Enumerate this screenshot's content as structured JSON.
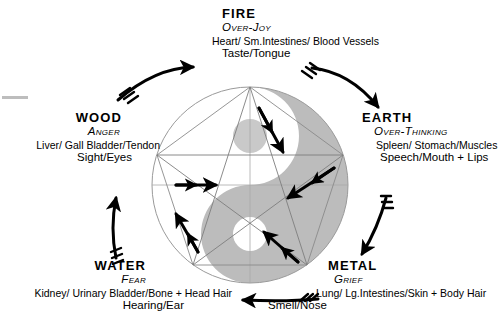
{
  "diagram": {
    "center_symbol": "yin-yang",
    "colors": {
      "yin_grey": "#b9b9b9",
      "line_grey": "#8c8c8c",
      "ink": "#000000",
      "background": "#ffffff"
    },
    "elements": [
      {
        "id": "fire",
        "name": "FIRE",
        "emotion": "Over-Joy",
        "organs": [
          {
            "text": "Heart",
            "style": "bold"
          },
          {
            "text": "Sm.Intestines",
            "style": "bold-italic"
          },
          {
            "text": "Blood Vessels",
            "style": "small-caps"
          }
        ],
        "organs_text": "Heart/ Sm.Intestines/ Blood Vessels",
        "sense": "Taste",
        "sense_organ": "Tongue",
        "sense_text": "Taste/Tongue",
        "position": "top"
      },
      {
        "id": "wood",
        "name": "WOOD",
        "emotion": "Anger",
        "organs": [
          {
            "text": "Liver",
            "style": "bold"
          },
          {
            "text": "Gall Bladder",
            "style": "bold-italic"
          },
          {
            "text": "Tendon",
            "style": "small-caps"
          }
        ],
        "organs_text": "Liver/ Gall Bladder/Tendon",
        "sense": "Sight",
        "sense_organ": "Eyes",
        "sense_text": "Sight/Eyes",
        "position": "left"
      },
      {
        "id": "earth",
        "name": "EARTH",
        "emotion": "Over-Thinking",
        "organs": [
          {
            "text": "Spleen",
            "style": "bold"
          },
          {
            "text": "Stomach",
            "style": "bold-italic"
          },
          {
            "text": "Muscles",
            "style": "small-caps"
          }
        ],
        "organs_text": "Spleen/ Stomach/Muscles",
        "sense": "Speech",
        "sense_organ": "Mouth + Lips",
        "sense_text": "Speech/Mouth + Lips",
        "position": "right"
      },
      {
        "id": "metal",
        "name": "METAL",
        "emotion": "Grief",
        "organs": [
          {
            "text": "Lung",
            "style": "bold"
          },
          {
            "text": "Lg.Intestines",
            "style": "bold-italic"
          },
          {
            "text": "Skin + Body Hair",
            "style": "small-caps"
          }
        ],
        "organs_text": "Lung/ Lg.Intestines/Skin + Body Hair",
        "sense": "Smell",
        "sense_organ": "Nose",
        "sense_text": "Smell/Nose",
        "position": "bottom-right"
      },
      {
        "id": "water",
        "name": "WATER",
        "emotion": "Fear",
        "organs": [
          {
            "text": "Kidney",
            "style": "bold"
          },
          {
            "text": "Urinary Bladder",
            "style": "bold-italic"
          },
          {
            "text": "Bone + Head Hair",
            "style": "small-caps"
          }
        ],
        "organs_text": "Kidney/ Urinary Bladder/Bone + Head Hair",
        "sense": "Hearing",
        "sense_organ": "Ear",
        "sense_text": "Hearing/Ear",
        "position": "bottom-left"
      }
    ],
    "generating_cycle": [
      {
        "from": "wood",
        "to": "fire",
        "arc": "outer-top-left"
      },
      {
        "from": "fire",
        "to": "earth",
        "arc": "outer-top-right"
      },
      {
        "from": "earth",
        "to": "metal",
        "arc": "outer-right"
      },
      {
        "from": "metal",
        "to": "water",
        "arc": "outer-bottom"
      },
      {
        "from": "water",
        "to": "wood",
        "arc": "outer-left"
      }
    ],
    "controlling_cycle": [
      {
        "from": "wood",
        "to": "earth"
      },
      {
        "from": "earth",
        "to": "water"
      },
      {
        "from": "water",
        "to": "fire"
      },
      {
        "from": "fire",
        "to": "metal"
      },
      {
        "from": "metal",
        "to": "wood"
      }
    ]
  }
}
